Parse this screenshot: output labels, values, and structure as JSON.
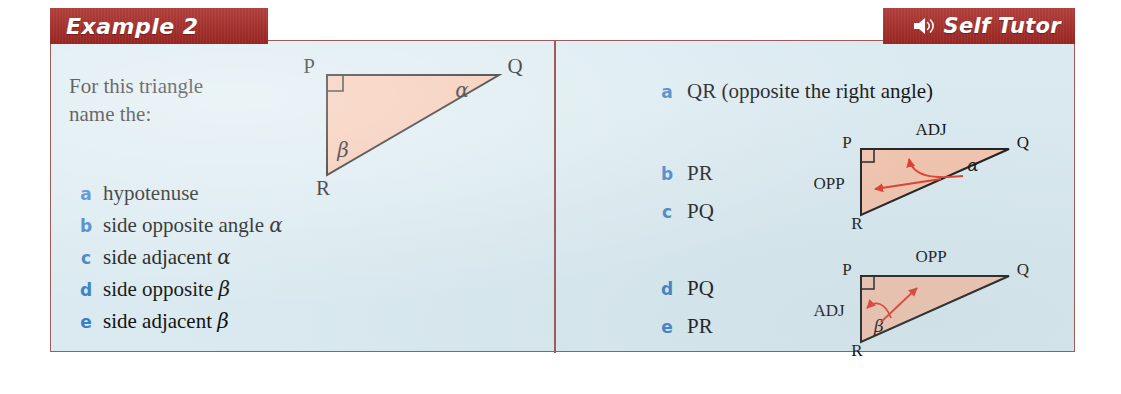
{
  "banners": {
    "example_label": "Example 2",
    "tutor_label": "Self Tutor",
    "speaker_icon": "speaker-icon",
    "banner_color": "#a82a26",
    "banner_text_color": "#ffffff"
  },
  "card": {
    "background_color": "#daeaf0",
    "border_color": "#a05a5a",
    "divider_color": "#a05a5a"
  },
  "left": {
    "intro_line1": "For this triangle",
    "intro_line2": "name the:",
    "bullet_color": "#3b7ec4",
    "items": [
      {
        "marker": "a",
        "text": "hypotenuse",
        "greek": ""
      },
      {
        "marker": "b",
        "text": "side opposite angle ",
        "greek": "α"
      },
      {
        "marker": "c",
        "text": "side adjacent ",
        "greek": "α"
      },
      {
        "marker": "d",
        "text": "side opposite ",
        "greek": "β"
      },
      {
        "marker": "e",
        "text": "side adjacent ",
        "greek": "β"
      }
    ],
    "triangle": {
      "vertex_p": "P",
      "vertex_q": "Q",
      "vertex_r": "R",
      "angle_q": "α",
      "angle_r": "β",
      "right_angle_at": "P",
      "fill_color": "#f4c4ad",
      "stroke_color": "#1a1a1a"
    }
  },
  "right": {
    "bullet_color": "#3b7ec4",
    "answers": [
      {
        "marker": "a",
        "text": "QR   (opposite the right angle)"
      },
      {
        "marker": "b",
        "text": "PR"
      },
      {
        "marker": "c",
        "text": "PQ"
      },
      {
        "marker": "d",
        "text": "PQ"
      },
      {
        "marker": "e",
        "text": "PR"
      }
    ],
    "diagram1": {
      "vertex_p": "P",
      "vertex_q": "Q",
      "vertex_r": "R",
      "angle": "α",
      "label_top": "ADJ",
      "label_left": "OPP",
      "fill_color": "#f4c4ad",
      "stroke_color": "#1a1a1a",
      "arrow_color": "#e03a28"
    },
    "diagram2": {
      "vertex_p": "P",
      "vertex_q": "Q",
      "vertex_r": "R",
      "angle": "β",
      "label_top": "OPP",
      "label_left": "ADJ",
      "fill_color": "#f4c4ad",
      "stroke_color": "#1a1a1a",
      "arrow_color": "#e03a28"
    }
  }
}
